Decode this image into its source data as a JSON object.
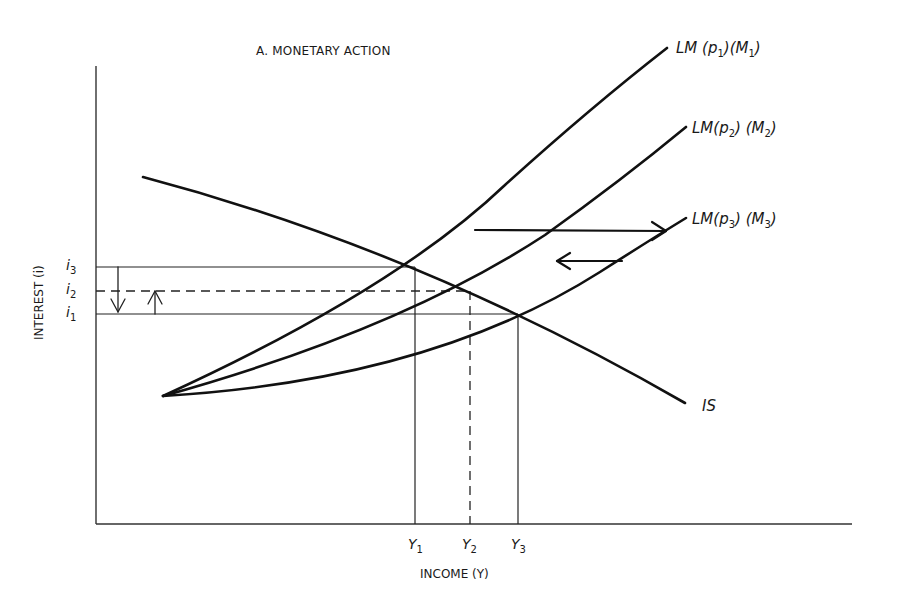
{
  "diagram": {
    "title": "A. MONETARY ACTION",
    "x_axis_label": "INCOME (Y)",
    "y_axis_label": "INTEREST (i)",
    "curves": [
      {
        "id": "LM1",
        "label_main": "LM (p",
        "sub1": "1",
        "label_mid": ")(M",
        "sub2": "1",
        "label_end": ")"
      },
      {
        "id": "LM2",
        "label_main": "LM(p",
        "sub1": "2",
        "label_mid": ") (M",
        "sub2": "2",
        "label_end": ")"
      },
      {
        "id": "LM3",
        "label_main": "LM(p",
        "sub1": "3",
        "label_mid": ") (M",
        "sub2": "3",
        "label_end": ")"
      },
      {
        "id": "IS",
        "label_main": "IS"
      }
    ],
    "y_ticks": [
      {
        "base": "i",
        "sub": "3"
      },
      {
        "base": "i",
        "sub": "2"
      },
      {
        "base": "i",
        "sub": "1"
      }
    ],
    "x_ticks": [
      {
        "base": "Y",
        "sub": "1"
      },
      {
        "base": "Y",
        "sub": "2"
      },
      {
        "base": "Y",
        "sub": "3"
      }
    ],
    "equilibria": [
      {
        "name": "E1",
        "curve": "LM1 ∩ IS",
        "income": "Y1",
        "interest": "i3"
      },
      {
        "name": "E2",
        "curve": "LM2 ∩ IS",
        "income": "Y2",
        "interest": "i2",
        "guides": "dashed"
      },
      {
        "name": "E3",
        "curve": "LM3 ∩ IS",
        "income": "Y3",
        "interest": "i1"
      }
    ],
    "shifts": [
      {
        "from": "LM1",
        "to": "LM3",
        "direction": "right",
        "meaning": "money supply increase"
      },
      {
        "from": "LM3",
        "to": "LM2",
        "direction": "left",
        "meaning": "price level rise"
      }
    ],
    "interest_arrows": [
      {
        "from": "i3",
        "to": "i1",
        "direction": "down"
      },
      {
        "from": "i1",
        "to": "i2",
        "direction": "up"
      }
    ]
  }
}
